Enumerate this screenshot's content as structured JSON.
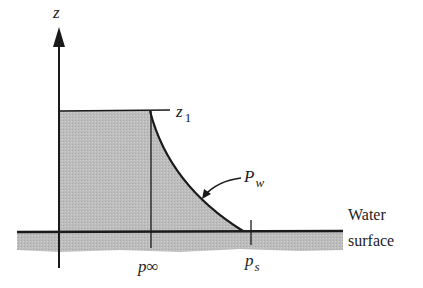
{
  "figure": {
    "axis_label": "z",
    "level_label": "z",
    "level_subscript": "1",
    "curve_label": "P",
    "curve_subscript": "w",
    "p_inf_label": "p",
    "p_inf_subscript": "∞",
    "ps_label": "p",
    "ps_subscript": "s",
    "water_label_line1": "Water",
    "water_label_line2": "surface"
  },
  "colors": {
    "fill": "#b8b8b8",
    "ink": "#1a1a1a",
    "background": "#ffffff"
  }
}
